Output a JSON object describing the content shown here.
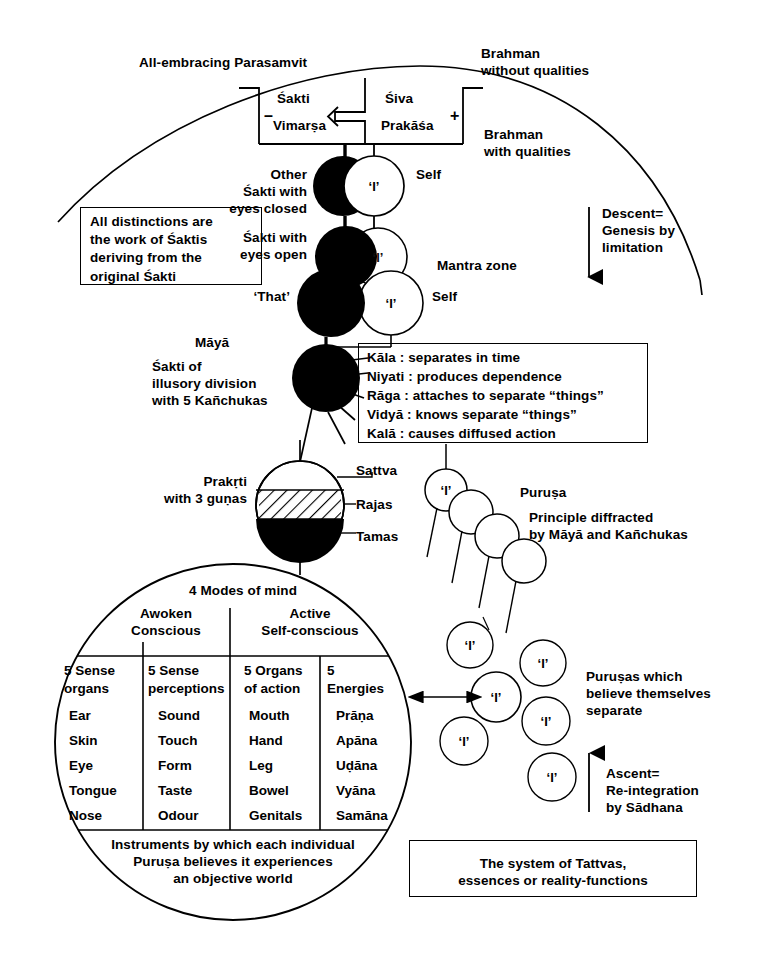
{
  "top": {
    "parasamvit": "All-embracing Parasamvit",
    "brahman_without": "Brahman\nwithout qualities",
    "brahman_with": "Brahman\nwith qualities",
    "sakti": "Śakti",
    "vimarsa": "Vimarṣa",
    "siva": "Śiva",
    "prakasa": "Prakāśa",
    "minus_sign": "–",
    "plus_sign": "+"
  },
  "notes": {
    "distinctions": "All distinctions are\nthe work of Śaktis\nderiving from the\noriginal Śakti",
    "descent": "Descent=\nGenesis by\nlimitation",
    "ascent": "Ascent=\nRe-integration\nby Sādhana",
    "system": "The system of Tattvas,\nessences or reality-functions"
  },
  "pairs": [
    {
      "left_label": "Other\nŚakti with\neyes closed",
      "center_glyph": "‘I’",
      "right_label": "Self"
    },
    {
      "left_label": "Śakti with\neyes open",
      "center_glyph": "‘I’",
      "right_label": ""
    },
    {
      "left_label": "‘That’",
      "center_glyph": "‘I’",
      "right_label": "Self",
      "zone_label": "Mantra zone"
    }
  ],
  "maya": {
    "title": "Māyā",
    "desc": "Śakti of\nillusory division\nwith 5 Kañchukas",
    "kanchukas": [
      "Kāla : separates in time",
      "Niyati : produces dependence",
      "Rāga : attaches to separate “things”",
      "Vidyā : knows separate “things”",
      "Kalā : causes diffused action"
    ]
  },
  "prakrti": {
    "label": "Prakṛti\nwith 3 guṇas",
    "gunas": [
      "Sattva",
      "Rajas",
      "Tamas"
    ]
  },
  "purusa": {
    "title": "Puruṣa",
    "desc": "Principle diffracted\nby Māyā and Kañchukas",
    "separate_label": "Puruṣas which\nbelieve themselves\nseparate",
    "glyph": "‘I’"
  },
  "mind_circle": {
    "title": "4 Modes of mind",
    "modes": [
      "Awoken\nConscious",
      "Active\nSelf-conscious"
    ],
    "columns": [
      {
        "header": "5 Sense\norgans",
        "items": [
          "Ear",
          "Skin",
          "Eye",
          "Tongue",
          "Nose"
        ]
      },
      {
        "header": "5 Sense\nperceptions",
        "items": [
          "Sound",
          "Touch",
          "Form",
          "Taste",
          "Odour"
        ]
      },
      {
        "header": "5 Organs\nof action",
        "items": [
          "Mouth",
          "Hand",
          "Leg",
          "Bowel",
          "Genitals"
        ]
      },
      {
        "header": "5\nEnergies",
        "items": [
          "Prāṇa",
          "Apāna",
          "Uḍāna",
          "Vyāna",
          "Samāna"
        ]
      }
    ],
    "footer": "Instruments by which each individual\nPuruṣa believes it experiences\nan objective world"
  },
  "colors": {
    "ink": "#000000",
    "paper": "#ffffff"
  }
}
